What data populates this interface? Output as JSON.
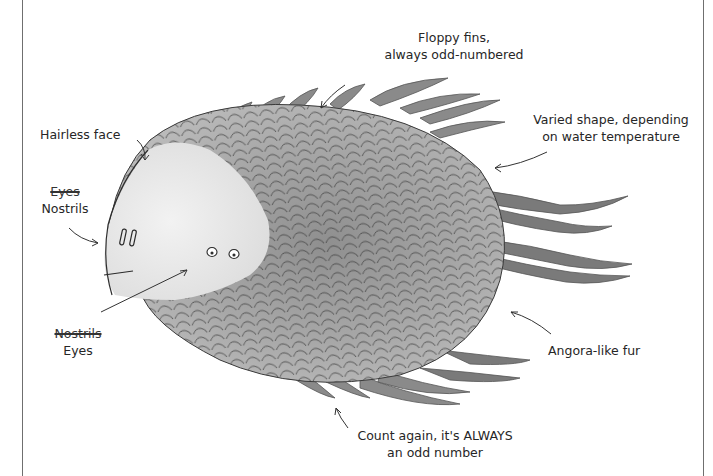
{
  "illustration": {
    "subject": "furry fish-like creature",
    "palette": {
      "background": "#ffffff",
      "ink": "#2a2a2a",
      "fur_light": "#c9c9c9",
      "fur_mid": "#9e9e9e",
      "fur_dark": "#777777",
      "face": "#ebebeb",
      "frame": "#6f6f6f"
    }
  },
  "annotations": {
    "fins": {
      "line1": "Floppy fins,",
      "line2": "always odd-numbered"
    },
    "tail": {
      "line1": "Varied shape, depending",
      "line2": "on water temperature"
    },
    "face": {
      "text": "Hairless face"
    },
    "nostrils": {
      "struck": "Eyes",
      "text": "Nostrils"
    },
    "eyes": {
      "struck": "Nostrils",
      "text": "Eyes"
    },
    "fur": {
      "text": "Angora-like fur"
    },
    "count": {
      "line1": "Count again, it's ALWAYS",
      "line2": "an odd number"
    }
  }
}
